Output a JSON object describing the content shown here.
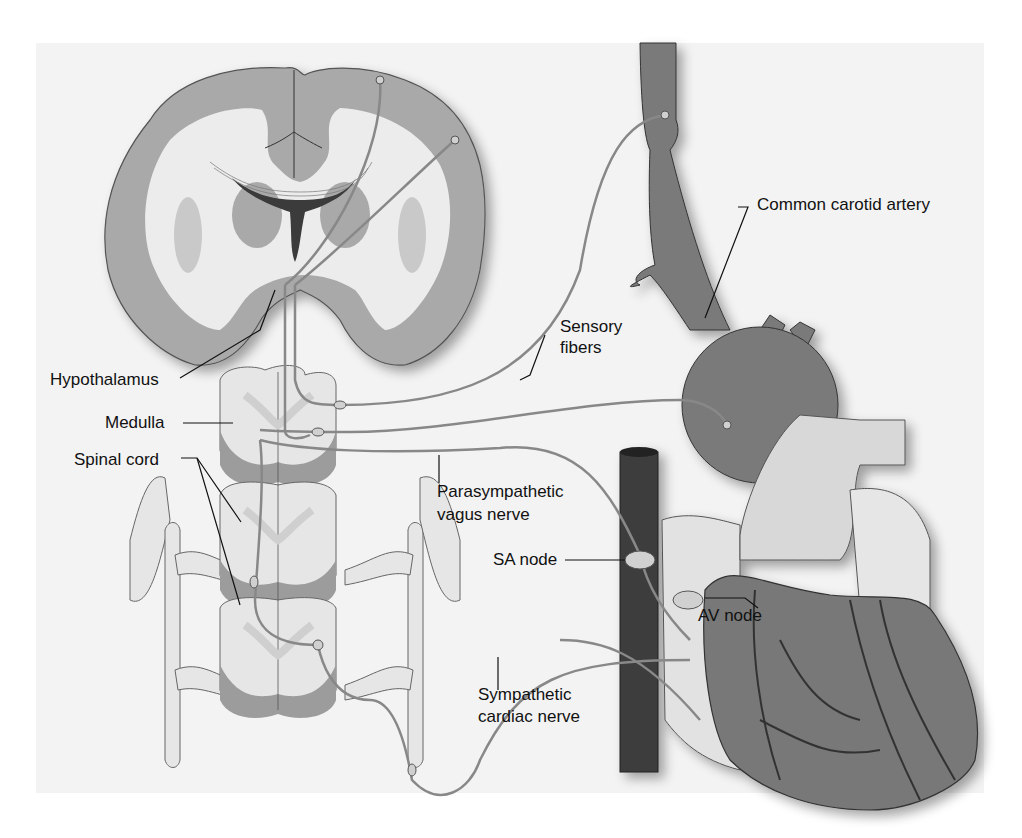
{
  "figure": {
    "colors": {
      "background": "#f3f3f3",
      "brain_gray_matter": "#a9a9a9",
      "brain_white_matter": "#ececec",
      "ventricle": "#3a3a3a",
      "spinal_cord_light": "#e6e6e6",
      "spinal_cord_dark": "#9c9c9c",
      "artery": "#7a7a7a",
      "heart_muscle": "#787878",
      "vena_cava": "#3c3c3c",
      "atria_light": "#e2e2e2",
      "nerve": "#888888",
      "label_text": "#111111"
    }
  },
  "labels": {
    "common_carotid": "Common carotid artery",
    "sensory_1": "Sensory",
    "sensory_2": "fibers",
    "hypothalamus": "Hypothalamus",
    "medulla": "Medulla",
    "spinal_cord": "Spinal cord",
    "parasympathetic_1": "Parasympathetic",
    "parasympathetic_2": "vagus nerve",
    "sa_node": "SA node",
    "av_node": "AV node",
    "sympathetic_1": "Sympathetic",
    "sympathetic_2": "cardiac nerve"
  }
}
